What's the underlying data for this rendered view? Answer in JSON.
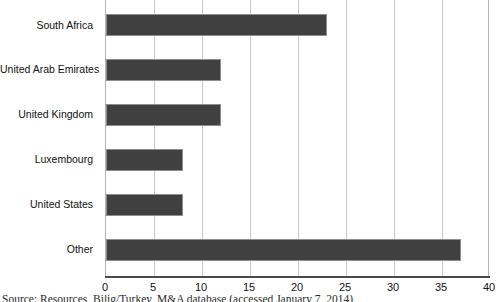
{
  "chart_data": {
    "type": "bar",
    "orientation": "horizontal",
    "title": "",
    "xlabel": "",
    "ylabel": "",
    "categories": [
      "South Africa",
      "United Arab Emirates",
      "United Kingdom",
      "Luxembourg",
      "United States",
      "Other"
    ],
    "values": [
      23,
      12,
      12,
      8,
      8,
      37
    ],
    "xlim": [
      0,
      40
    ],
    "xticks": [
      0,
      5,
      10,
      15,
      20,
      25,
      30,
      35,
      40
    ],
    "xtick_labels": [
      "0",
      "5",
      "10",
      "15",
      "20",
      "25",
      "30",
      "35",
      "40"
    ],
    "grid": true,
    "grid_axis": "x",
    "legend": false,
    "bar_color": "#404040",
    "bar_edge_color": "#8e8e8e",
    "grid_color": "#c8c8c8",
    "axis_color": "#4a4a4a",
    "background": "#ffffff"
  },
  "caption": {
    "source_text": "Source: Resources, Bilig/Turkey, M&A database (accessed January 7, 2014)"
  }
}
